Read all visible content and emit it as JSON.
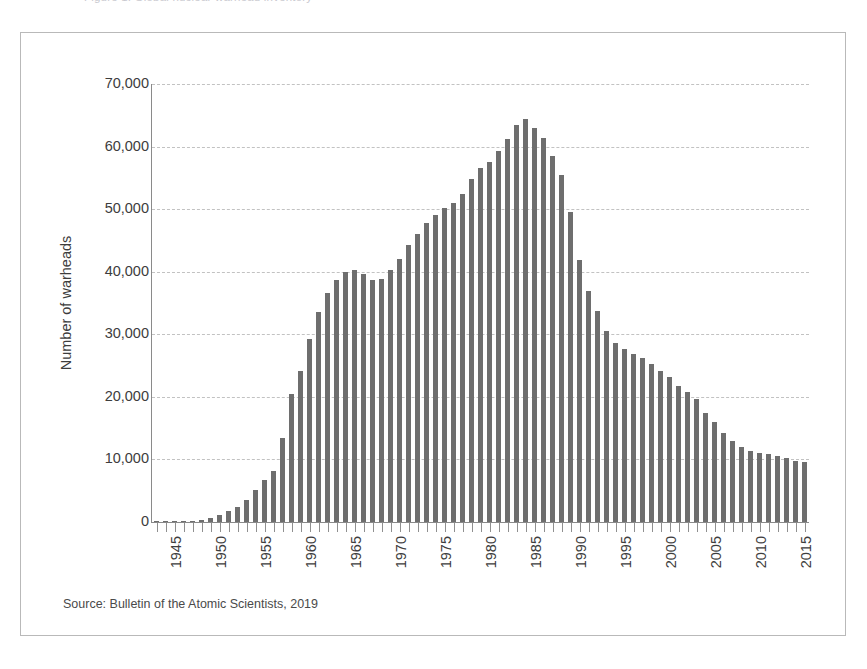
{
  "page": {
    "top_cut_caption": "Figure 1.  Global nuclear warhead inventory"
  },
  "figure": {
    "source_note": "Source: Bulletin of the Atomic Scientists, 2019",
    "bar_color": "#6e6e6e",
    "grid_color": "#c2c2c2",
    "axis_color": "#8a8a8a"
  },
  "chart_data": {
    "type": "bar",
    "title": "",
    "xlabel": "",
    "ylabel": "Number of warheads",
    "ylim": [
      0,
      70000
    ],
    "ytick_labels": [
      "0",
      "10,000",
      "20,000",
      "30,000",
      "40,000",
      "50,000",
      "60,000",
      "70,000"
    ],
    "ytick_values": [
      0,
      10000,
      20000,
      30000,
      40000,
      50000,
      60000,
      70000
    ],
    "xtick_labels": [
      "1945",
      "1950",
      "1955",
      "1960",
      "1965",
      "1970",
      "1975",
      "1980",
      "1985",
      "1990",
      "1995",
      "2000",
      "2005",
      "2010",
      "2015"
    ],
    "grid": true,
    "legend": "none",
    "categories": [
      1945,
      1946,
      1947,
      1948,
      1949,
      1950,
      1951,
      1952,
      1953,
      1954,
      1955,
      1956,
      1957,
      1958,
      1959,
      1960,
      1961,
      1962,
      1963,
      1964,
      1965,
      1966,
      1967,
      1968,
      1969,
      1970,
      1971,
      1972,
      1973,
      1974,
      1975,
      1976,
      1977,
      1978,
      1979,
      1980,
      1981,
      1982,
      1983,
      1984,
      1985,
      1986,
      1987,
      1988,
      1989,
      1990,
      1991,
      1992,
      1993,
      1994,
      1995,
      1996,
      1997,
      1998,
      1999,
      2000,
      2001,
      2002,
      2003,
      2004,
      2005,
      2006,
      2007,
      2008,
      2009,
      2010,
      2011,
      2012,
      2013,
      2014,
      2015,
      2016,
      2017
    ],
    "values": [
      2,
      11,
      32,
      110,
      235,
      369,
      640,
      1110,
      1703,
      2422,
      3595,
      5140,
      6780,
      8180,
      13350,
      20500,
      24100,
      29200,
      33500,
      36600,
      38600,
      39900,
      40300,
      39600,
      38700,
      38800,
      40300,
      42000,
      44200,
      46000,
      47800,
      49000,
      50200,
      51000,
      52500,
      54800,
      56500,
      57600,
      59300,
      61200,
      63500,
      64400,
      63000,
      61400,
      58500,
      55500,
      49500,
      41800,
      37000,
      33800,
      30500,
      28600,
      27600,
      26800,
      26200,
      25300,
      24200,
      23200,
      21800,
      20700,
      19600,
      17500,
      16000,
      14300,
      13000,
      12000,
      11400,
      11000,
      10800,
      10500,
      10200,
      9800,
      9600
    ]
  }
}
